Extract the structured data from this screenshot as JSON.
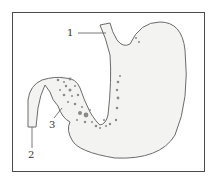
{
  "figure": {
    "labels": [
      {
        "id": "1",
        "text": "1"
      },
      {
        "id": "2",
        "text": "2"
      },
      {
        "id": "3",
        "text": "3"
      }
    ]
  },
  "colors": {
    "outline": "#6b6b6b",
    "fill": "#f3f4f1",
    "dots": "#8a8a8a",
    "frame": "#4a4a4a",
    "text": "#333333"
  }
}
